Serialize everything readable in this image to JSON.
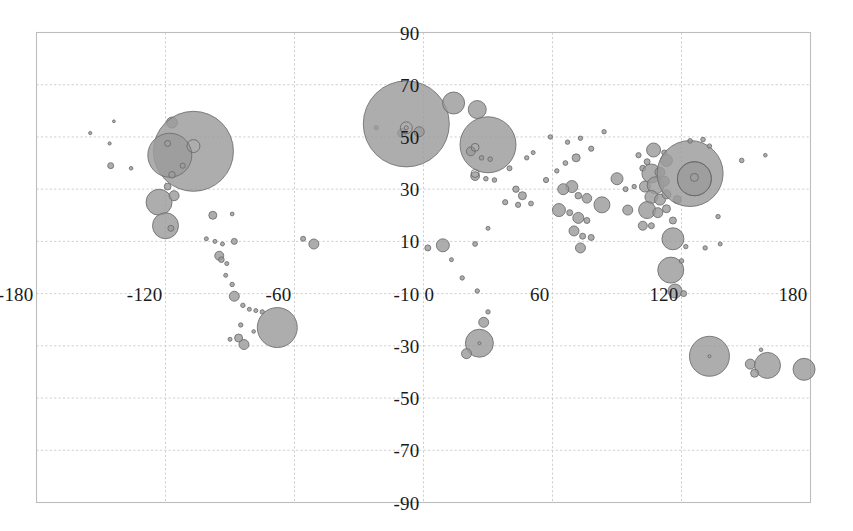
{
  "chart_data": {
    "type": "scatter",
    "title": "",
    "subtitle": "",
    "xlabel": "",
    "ylabel": "",
    "xlim": [
      -180,
      180
    ],
    "ylim": [
      -90,
      90
    ],
    "grid": true,
    "legend": null,
    "x_ticks": [
      -180,
      -120,
      -60,
      0,
      60,
      120,
      180
    ],
    "x_tick_labels": [
      "-180",
      "-120",
      "-60",
      "0",
      "60",
      "120",
      "180"
    ],
    "y_ticks": [
      90,
      70,
      50,
      30,
      10,
      -10,
      -30,
      -50,
      -70,
      -90
    ],
    "y_tick_labels": [
      "90",
      "70",
      "50",
      "30",
      "10",
      "-10",
      "-30",
      "-50",
      "-70",
      "-90"
    ],
    "marker_fill": "#9b9b9b",
    "marker_stroke": "#6b6b6b",
    "grid_color": "#c9c9c9",
    "frame_color": "#bdbdbd",
    "points": [
      {
        "x": -155.0,
        "y": 51.5,
        "r": 1.6
      },
      {
        "x": -144.0,
        "y": 56.0,
        "r": 1.4
      },
      {
        "x": -146.0,
        "y": 47.5,
        "r": 1.6
      },
      {
        "x": -145.5,
        "y": 39.0,
        "r": 3.0
      },
      {
        "x": -136.0,
        "y": 38.0,
        "r": 1.8
      },
      {
        "x": -117.0,
        "y": 55.5,
        "r": 5.5
      },
      {
        "x": -107.0,
        "y": 44.5,
        "r": 40.0
      },
      {
        "x": -118.0,
        "y": 43.0,
        "r": 22.0
      },
      {
        "x": -117.0,
        "y": 35.5,
        "r": 3.3
      },
      {
        "x": -112.0,
        "y": 39.0,
        "r": 2.6
      },
      {
        "x": -119.0,
        "y": 31.0,
        "r": 3.4
      },
      {
        "x": -123.0,
        "y": 25.0,
        "r": 13.0
      },
      {
        "x": -116.0,
        "y": 27.5,
        "r": 5.0
      },
      {
        "x": -120.0,
        "y": 16.0,
        "r": 13.0
      },
      {
        "x": -117.5,
        "y": 15.0,
        "r": 3.0
      },
      {
        "x": -98.0,
        "y": 20.0,
        "r": 4.0
      },
      {
        "x": -89.0,
        "y": 20.5,
        "r": 1.9
      },
      {
        "x": -101.0,
        "y": 11.0,
        "r": 2.0
      },
      {
        "x": -97.0,
        "y": 10.0,
        "r": 2.0
      },
      {
        "x": -93.5,
        "y": 9.0,
        "r": 2.0
      },
      {
        "x": -88.0,
        "y": 10.0,
        "r": 3.0
      },
      {
        "x": -95.0,
        "y": 4.5,
        "r": 4.5
      },
      {
        "x": -94.0,
        "y": 3.0,
        "r": 2.8
      },
      {
        "x": -91.5,
        "y": 1.5,
        "r": 2.0
      },
      {
        "x": -92.0,
        "y": -3.0,
        "r": 2.0
      },
      {
        "x": -89.0,
        "y": -6.5,
        "r": 2.2
      },
      {
        "x": -88.0,
        "y": -11.0,
        "r": 5.0
      },
      {
        "x": -84.0,
        "y": -14.5,
        "r": 2.2
      },
      {
        "x": -81.0,
        "y": -16.0,
        "r": 2.0
      },
      {
        "x": -78.0,
        "y": -16.5,
        "r": 2.0
      },
      {
        "x": -75.0,
        "y": -17.0,
        "r": 2.2
      },
      {
        "x": -85.0,
        "y": -22.0,
        "r": 2.2
      },
      {
        "x": -90.0,
        "y": -27.5,
        "r": 2.0
      },
      {
        "x": -86.0,
        "y": -27.0,
        "r": 4.0
      },
      {
        "x": -83.5,
        "y": -29.5,
        "r": 5.0
      },
      {
        "x": -68.0,
        "y": -23.0,
        "r": 20.0
      },
      {
        "x": -79.0,
        "y": -24.5,
        "r": 1.8
      },
      {
        "x": -56.0,
        "y": 11.0,
        "r": 2.5
      },
      {
        "x": -51.0,
        "y": 9.0,
        "r": 5.0
      },
      {
        "x": -22.0,
        "y": 53.5,
        "r": 2.2
      },
      {
        "x": -10.0,
        "y": 51.5,
        "r": 4.4
      },
      {
        "x": -8.0,
        "y": 55.0,
        "r": 43.0
      },
      {
        "x": -2.0,
        "y": 52.0,
        "r": 5.0
      },
      {
        "x": 14.0,
        "y": 63.0,
        "r": 11.0
      },
      {
        "x": 25.0,
        "y": 60.5,
        "r": 9.0
      },
      {
        "x": 30.0,
        "y": 47.0,
        "r": 28.0
      },
      {
        "x": 22.0,
        "y": 44.5,
        "r": 4.5
      },
      {
        "x": 27.0,
        "y": 42.0,
        "r": 2.3
      },
      {
        "x": 31.0,
        "y": 41.5,
        "r": 2.3
      },
      {
        "x": 24.0,
        "y": 35.0,
        "r": 4.4
      },
      {
        "x": 29.0,
        "y": 34.0,
        "r": 2.3
      },
      {
        "x": 33.0,
        "y": 33.5,
        "r": 2.3
      },
      {
        "x": 40.0,
        "y": 38.0,
        "r": 2.5
      },
      {
        "x": 43.0,
        "y": 30.0,
        "r": 3.2
      },
      {
        "x": 46.0,
        "y": 27.5,
        "r": 4.0
      },
      {
        "x": 48.0,
        "y": 42.0,
        "r": 2.2
      },
      {
        "x": 51.0,
        "y": 44.0,
        "r": 2.0
      },
      {
        "x": 38.0,
        "y": 25.0,
        "r": 2.6
      },
      {
        "x": 44.0,
        "y": 24.0,
        "r": 2.6
      },
      {
        "x": 50.0,
        "y": 24.5,
        "r": 2.4
      },
      {
        "x": 30.0,
        "y": 15.0,
        "r": 2.0
      },
      {
        "x": 24.0,
        "y": 9.0,
        "r": 2.4
      },
      {
        "x": 9.0,
        "y": 8.5,
        "r": 6.5
      },
      {
        "x": 2.0,
        "y": 7.5,
        "r": 3.0
      },
      {
        "x": 13.0,
        "y": 3.0,
        "r": 2.0
      },
      {
        "x": 18.0,
        "y": -4.0,
        "r": 2.2
      },
      {
        "x": 25.0,
        "y": -9.0,
        "r": 2.2
      },
      {
        "x": 28.0,
        "y": -21.0,
        "r": 5.0
      },
      {
        "x": 30.0,
        "y": -17.0,
        "r": 2.2
      },
      {
        "x": 26.0,
        "y": -29.0,
        "r": 14.0
      },
      {
        "x": 20.0,
        "y": -33.0,
        "r": 5.0
      },
      {
        "x": 59.0,
        "y": 50.0,
        "r": 2.2
      },
      {
        "x": 67.0,
        "y": 48.0,
        "r": 2.2
      },
      {
        "x": 73.0,
        "y": 49.5,
        "r": 2.2
      },
      {
        "x": 84.0,
        "y": 52.0,
        "r": 2.2
      },
      {
        "x": 78.0,
        "y": 45.5,
        "r": 2.6
      },
      {
        "x": 71.0,
        "y": 42.0,
        "r": 4.0
      },
      {
        "x": 66.0,
        "y": 40.0,
        "r": 2.4
      },
      {
        "x": 62.0,
        "y": 37.0,
        "r": 2.2
      },
      {
        "x": 57.0,
        "y": 33.5,
        "r": 2.6
      },
      {
        "x": 69.0,
        "y": 31.0,
        "r": 6.0
      },
      {
        "x": 65.0,
        "y": 30.0,
        "r": 5.5
      },
      {
        "x": 72.0,
        "y": 27.5,
        "r": 3.3
      },
      {
        "x": 76.0,
        "y": 26.5,
        "r": 4.8
      },
      {
        "x": 63.0,
        "y": 22.0,
        "r": 6.5
      },
      {
        "x": 68.0,
        "y": 21.0,
        "r": 3.0
      },
      {
        "x": 72.0,
        "y": 19.0,
        "r": 5.5
      },
      {
        "x": 76.0,
        "y": 18.0,
        "r": 3.0
      },
      {
        "x": 70.0,
        "y": 14.0,
        "r": 5.0
      },
      {
        "x": 74.0,
        "y": 12.0,
        "r": 3.0
      },
      {
        "x": 78.0,
        "y": 11.5,
        "r": 3.0
      },
      {
        "x": 73.0,
        "y": 7.5,
        "r": 5.0
      },
      {
        "x": 83.0,
        "y": 24.0,
        "r": 8.0
      },
      {
        "x": 90.0,
        "y": 34.0,
        "r": 6.0
      },
      {
        "x": 94.0,
        "y": 30.0,
        "r": 2.5
      },
      {
        "x": 98.0,
        "y": 31.0,
        "r": 2.2
      },
      {
        "x": 95.0,
        "y": 22.0,
        "r": 5.0
      },
      {
        "x": 102.0,
        "y": 38.0,
        "r": 3.0
      },
      {
        "x": 104.0,
        "y": 40.5,
        "r": 3.0
      },
      {
        "x": 100.0,
        "y": 43.0,
        "r": 2.6
      },
      {
        "x": 107.0,
        "y": 45.0,
        "r": 7.0
      },
      {
        "x": 112.0,
        "y": 44.0,
        "r": 2.6
      },
      {
        "x": 113.0,
        "y": 41.0,
        "r": 6.0
      },
      {
        "x": 106.0,
        "y": 36.0,
        "r": 9.5
      },
      {
        "x": 110.0,
        "y": 36.5,
        "r": 5.0
      },
      {
        "x": 103.0,
        "y": 31.0,
        "r": 5.5
      },
      {
        "x": 108.0,
        "y": 31.5,
        "r": 8.5
      },
      {
        "x": 112.0,
        "y": 33.0,
        "r": 5.0
      },
      {
        "x": 106.0,
        "y": 27.0,
        "r": 6.5
      },
      {
        "x": 110.0,
        "y": 26.0,
        "r": 5.5
      },
      {
        "x": 113.0,
        "y": 28.0,
        "r": 4.5
      },
      {
        "x": 104.0,
        "y": 22.0,
        "r": 8.5
      },
      {
        "x": 109.0,
        "y": 21.0,
        "r": 5.0
      },
      {
        "x": 113.0,
        "y": 22.5,
        "r": 4.0
      },
      {
        "x": 118.0,
        "y": 26.0,
        "r": 4.0
      },
      {
        "x": 102.0,
        "y": 16.0,
        "r": 4.5
      },
      {
        "x": 106.0,
        "y": 16.0,
        "r": 3.0
      },
      {
        "x": 116.0,
        "y": 18.0,
        "r": 3.5
      },
      {
        "x": 124.0,
        "y": 36.0,
        "r": 33.0
      },
      {
        "x": 126.0,
        "y": 34.0,
        "r": 17.0
      },
      {
        "x": 124.0,
        "y": 48.5,
        "r": 2.3
      },
      {
        "x": 130.0,
        "y": 49.0,
        "r": 2.3
      },
      {
        "x": 133.0,
        "y": 46.5,
        "r": 2.2
      },
      {
        "x": 116.0,
        "y": 11.0,
        "r": 11.0
      },
      {
        "x": 122.0,
        "y": 8.0,
        "r": 2.2
      },
      {
        "x": 115.0,
        "y": -1.0,
        "r": 13.0
      },
      {
        "x": 117.0,
        "y": -9.0,
        "r": 7.0
      },
      {
        "x": 121.0,
        "y": -10.0,
        "r": 3.0
      },
      {
        "x": 120.0,
        "y": 2.5,
        "r": 2.3
      },
      {
        "x": 133.0,
        "y": -34.0,
        "r": 20.0
      },
      {
        "x": 152.0,
        "y": -37.0,
        "r": 5.0
      },
      {
        "x": 157.0,
        "y": -31.5,
        "r": 1.8
      },
      {
        "x": 160.0,
        "y": -37.5,
        "r": 13.0
      },
      {
        "x": 154.0,
        "y": -40.5,
        "r": 4.0
      },
      {
        "x": 177.0,
        "y": -39.0,
        "r": 11.0
      },
      {
        "x": 148.0,
        "y": 41.0,
        "r": 2.3
      },
      {
        "x": 159.0,
        "y": 43.0,
        "r": 1.8
      },
      {
        "x": 137.0,
        "y": 19.5,
        "r": 2.2
      },
      {
        "x": 131.0,
        "y": 7.5,
        "r": 2.2
      },
      {
        "x": 138.0,
        "y": 9.0,
        "r": 2.0
      }
    ],
    "rings": [
      {
        "x": -107.0,
        "y": 46.5,
        "r": 6.5
      },
      {
        "x": -119.0,
        "y": 47.5,
        "r": 3.0
      },
      {
        "x": -8.0,
        "y": 53.5,
        "r": 6.0
      },
      {
        "x": -8.0,
        "y": 53.5,
        "r": 2.0
      },
      {
        "x": 24.0,
        "y": 46.0,
        "r": 4.0
      },
      {
        "x": 24.0,
        "y": 36.0,
        "r": 4.0
      },
      {
        "x": 126.0,
        "y": 34.0,
        "r": 17.0
      },
      {
        "x": 126.0,
        "y": 34.5,
        "r": 4.0
      },
      {
        "x": 133.0,
        "y": -34.0,
        "r": 1.5
      },
      {
        "x": 26.0,
        "y": -29.0,
        "r": 1.5
      }
    ]
  },
  "axes": {
    "x_labels": [
      {
        "text": "-180",
        "value": -180
      },
      {
        "text": "-120",
        "value": -120
      },
      {
        "text": "-60",
        "value": -60
      },
      {
        "text": "0",
        "value": 0
      },
      {
        "text": "60",
        "value": 60
      },
      {
        "text": "120",
        "value": 120
      },
      {
        "text": "180",
        "value": 180
      }
    ],
    "y_labels": [
      {
        "text": "90",
        "value": 90
      },
      {
        "text": "70",
        "value": 70
      },
      {
        "text": "50",
        "value": 50
      },
      {
        "text": "30",
        "value": 30
      },
      {
        "text": "10",
        "value": 10
      },
      {
        "text": "-10",
        "value": -10
      },
      {
        "text": "-30",
        "value": -30
      },
      {
        "text": "-50",
        "value": -50
      },
      {
        "text": "-70",
        "value": -70
      },
      {
        "text": "-90",
        "value": -90
      }
    ]
  }
}
